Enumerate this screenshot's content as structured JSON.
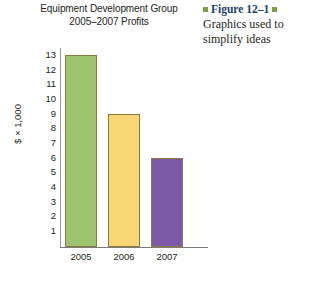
{
  "chart_data": {
    "type": "bar",
    "title": "Equipment Development Group 2005–2007 Profits",
    "title_lines": [
      "Equipment Development Group",
      "2005–2007 Profits"
    ],
    "categories": [
      "2005",
      "2006",
      "2007"
    ],
    "values": [
      13,
      9,
      6
    ],
    "series": [
      {
        "name": "Profits",
        "values": [
          13,
          9,
          6
        ]
      }
    ],
    "xlabel": "",
    "ylabel": "$ × 1,000",
    "ylim": [
      0,
      13.6
    ],
    "yticks": [
      1,
      2,
      3,
      4,
      5,
      6,
      7,
      8,
      9,
      10,
      11,
      12,
      13
    ],
    "ytick_labels": [
      "1",
      "2",
      "3",
      "4",
      "5",
      "6",
      "7",
      "8",
      "9",
      "10",
      "11",
      "12",
      "13"
    ],
    "grid": false,
    "legend": false,
    "bar_colors": [
      "#9fc470",
      "#f7d673",
      "#7d5aa8"
    ],
    "bar_border_color": "#8a7a3c"
  },
  "caption": {
    "figure_label": "Figure 12–1",
    "text": "Graphics used to simplify ideas",
    "bullet_color": "#7f9c3f",
    "label_color": "#1c3f6e"
  }
}
